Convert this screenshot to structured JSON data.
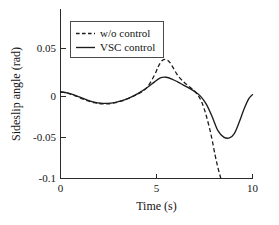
{
  "chart_data": {
    "type": "line",
    "title": "",
    "xlabel": "Time (s)",
    "ylabel": "Sideslip angle (rad)",
    "xlim": [
      0,
      10
    ],
    "ylim": [
      -0.1,
      0.075
    ],
    "xticks": [
      0,
      5,
      10
    ],
    "xticklabels": [
      "0",
      "5",
      "10"
    ],
    "yticks": [
      0.05,
      0,
      -0.05,
      -0.1
    ],
    "yticklabels": [
      "0.05",
      "0",
      "-0.05",
      "-0.1"
    ],
    "grid": false,
    "legend_position": "upper left",
    "series": [
      {
        "name": "w/o control",
        "style": "dashed",
        "color": "#1c1c1c",
        "x": [
          0,
          0.35,
          0.7,
          1.05,
          1.4,
          1.75,
          2.1,
          2.45,
          2.8,
          3.15,
          3.5,
          3.85,
          4.2,
          4.55,
          4.9,
          5.1,
          5.3,
          5.5,
          5.7,
          5.9,
          6.1,
          6.35,
          6.6,
          6.85,
          7.1,
          7.35,
          7.6,
          7.85,
          8.05,
          8.2,
          8.35
        ],
        "y": [
          0,
          -0.0015,
          -0.004,
          -0.0072,
          -0.0102,
          -0.0125,
          -0.0138,
          -0.0138,
          -0.0128,
          -0.0108,
          -0.008,
          -0.0045,
          -0.0005,
          0.0062,
          0.0195,
          0.0295,
          0.0362,
          0.0372,
          0.0338,
          0.0265,
          0.0192,
          0.0128,
          0.0078,
          0.0035,
          -0.0022,
          -0.0115,
          -0.0282,
          -0.0505,
          -0.0728,
          -0.0875,
          -0.1
        ]
      },
      {
        "name": "VSC control",
        "style": "solid",
        "color": "#1c1c1c",
        "x": [
          0,
          0.35,
          0.7,
          1.05,
          1.4,
          1.75,
          2.1,
          2.45,
          2.8,
          3.15,
          3.5,
          3.85,
          4.2,
          4.55,
          4.9,
          5.2,
          5.5,
          5.8,
          6.1,
          6.4,
          6.7,
          7,
          7.3,
          7.6,
          7.9,
          8.2,
          8.5,
          8.8,
          9.05,
          9.3,
          9.55,
          9.8,
          10
        ],
        "y": [
          0,
          -0.0012,
          -0.0035,
          -0.0065,
          -0.0095,
          -0.0118,
          -0.0132,
          -0.0133,
          -0.0124,
          -0.0105,
          -0.0078,
          -0.0042,
          0.0002,
          0.0055,
          0.0115,
          0.0162,
          0.0168,
          0.0148,
          0.0115,
          0.0078,
          0.0042,
          0.0002,
          -0.0052,
          -0.0145,
          -0.0288,
          -0.0448,
          -0.0522,
          -0.0532,
          -0.0482,
          -0.0355,
          -0.0205,
          -0.0082,
          -0.0032
        ]
      }
    ]
  },
  "legend": {
    "entries": [
      {
        "label": "w/o control",
        "style": "dashed"
      },
      {
        "label": "VSC control",
        "style": "solid"
      }
    ]
  }
}
